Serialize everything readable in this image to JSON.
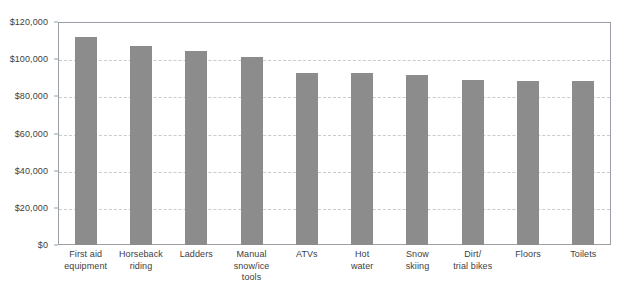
{
  "chart_data": {
    "type": "bar",
    "title": "",
    "subtitle": "",
    "xlabel": "",
    "ylabel": "",
    "ylim": [
      0,
      120000
    ],
    "ytick_step": 20000,
    "grid": true,
    "grid_axis": "y",
    "grid_style": "dashed",
    "legend": "none",
    "bar_color": "#8c8c8c",
    "axis_color": "#9aa0a6",
    "gridline_color": "#c8ccd0",
    "text_color": "#3c4043",
    "categories": [
      "First aid equipment",
      "Horseback riding",
      "Ladders",
      "Manual snow/ice tools",
      "ATVs",
      "Hot water",
      "Snow skiing",
      "Dirt/ trial bikes",
      "Floors",
      "Toilets"
    ],
    "category_lines": [
      [
        "First aid",
        "equipment"
      ],
      [
        "Horseback",
        "riding"
      ],
      [
        "Ladders"
      ],
      [
        "Manual",
        "snow/ice tools"
      ],
      [
        "ATVs"
      ],
      [
        "Hot",
        "water"
      ],
      [
        "Snow",
        "skiing"
      ],
      [
        "Dirt/",
        "trial bikes"
      ],
      [
        "Floors"
      ],
      [
        "Toilets"
      ]
    ],
    "values": [
      112000,
      107000,
      104500,
      101000,
      92500,
      92500,
      91500,
      89000,
      88000,
      88000
    ],
    "ytick_labels": [
      "$0",
      "$20,000",
      "$40,000",
      "$60,000",
      "$80,000",
      "$100,000",
      "$120,000"
    ],
    "ytick_values": [
      0,
      20000,
      40000,
      60000,
      80000,
      100000,
      120000
    ]
  }
}
